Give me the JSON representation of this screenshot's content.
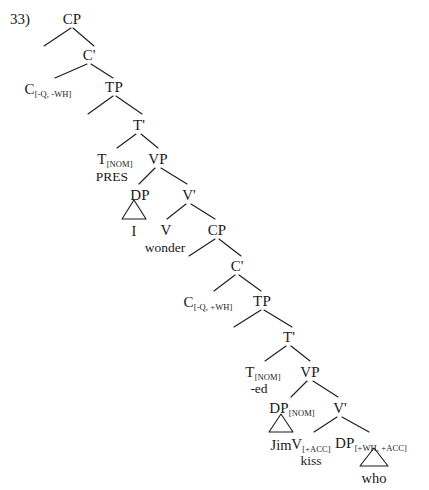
{
  "figure": {
    "example_number": "33)",
    "type": "syntax-tree",
    "sentence": "I wonder who Jim kissed"
  },
  "nodes": [
    {
      "id": "cp1",
      "label": "CP",
      "sub": "",
      "x": 72,
      "y": 12
    },
    {
      "id": "cbar1",
      "label": "C'",
      "sub": "",
      "x": 89,
      "y": 48
    },
    {
      "id": "c1",
      "label": "C",
      "sub": "[-Q, -WH]",
      "x": 48,
      "y": 82
    },
    {
      "id": "tp1",
      "label": "TP",
      "sub": "",
      "x": 114,
      "y": 80
    },
    {
      "id": "tbar1",
      "label": "T'",
      "sub": "",
      "x": 139,
      "y": 118
    },
    {
      "id": "t1",
      "label": "T",
      "sub": "[NOM]",
      "x": 115,
      "y": 152
    },
    {
      "id": "vp1",
      "label": "VP",
      "sub": "",
      "x": 158,
      "y": 152
    },
    {
      "id": "dp1",
      "label": "DP",
      "sub": "",
      "x": 140,
      "y": 188
    },
    {
      "id": "vbar1",
      "label": "V'",
      "sub": "",
      "x": 189,
      "y": 188
    },
    {
      "id": "v1",
      "label": "V",
      "sub": "",
      "x": 166,
      "y": 223
    },
    {
      "id": "cp2",
      "label": "CP",
      "sub": "",
      "x": 217,
      "y": 223
    },
    {
      "id": "cbar2",
      "label": "C'",
      "sub": "",
      "x": 237,
      "y": 259
    },
    {
      "id": "c2",
      "label": "C",
      "sub": "[-Q, +WH]",
      "x": 208,
      "y": 295
    },
    {
      "id": "tp2",
      "label": "TP",
      "sub": "",
      "x": 262,
      "y": 294
    },
    {
      "id": "tbar2",
      "label": "T'",
      "sub": "",
      "x": 289,
      "y": 330
    },
    {
      "id": "t2",
      "label": "T",
      "sub": "[NOM]",
      "x": 263,
      "y": 365
    },
    {
      "id": "vp2",
      "label": "VP",
      "sub": "",
      "x": 310,
      "y": 365
    },
    {
      "id": "dp2",
      "label": "DP",
      "sub": "[NOM]",
      "x": 292,
      "y": 401
    },
    {
      "id": "vbar2",
      "label": "V'",
      "sub": "",
      "x": 340,
      "y": 401
    },
    {
      "id": "v2",
      "label": "V",
      "sub": "[+ACC]",
      "x": 311,
      "y": 437
    },
    {
      "id": "dp3",
      "label": "DP",
      "sub": "[+WH, +ACC]",
      "x": 371,
      "y": 436
    }
  ],
  "leaves": [
    {
      "id": "leaf-i",
      "text": "I",
      "x": 134,
      "y": 224
    },
    {
      "id": "leaf-jim",
      "text": "Jim",
      "x": 281,
      "y": 438
    },
    {
      "id": "leaf-who",
      "text": "who",
      "x": 374,
      "y": 471
    }
  ],
  "morphemes": [
    {
      "id": "morph-pres",
      "text": "PRES",
      "x": 112,
      "y": 170
    },
    {
      "id": "morph-ed",
      "text": "-ed",
      "x": 259,
      "y": 382
    },
    {
      "id": "morph-wonder",
      "text": "wonder",
      "x": 165,
      "y": 241
    },
    {
      "id": "morph-kiss",
      "text": "kiss",
      "x": 311,
      "y": 454
    }
  ],
  "branches": [
    {
      "id": "cp1-spec",
      "x1": 71,
      "y1": 28,
      "x2": 44,
      "y2": 46
    },
    {
      "id": "cp1-cbar",
      "x1": 73,
      "y1": 28,
      "x2": 94,
      "y2": 46
    },
    {
      "id": "cbar1-c",
      "x1": 87,
      "y1": 64,
      "x2": 55,
      "y2": 78
    },
    {
      "id": "cbar1-tp",
      "x1": 91,
      "y1": 64,
      "x2": 113,
      "y2": 78
    },
    {
      "id": "tp1-spec",
      "x1": 113,
      "y1": 96,
      "x2": 88,
      "y2": 114
    },
    {
      "id": "tp1-tbar",
      "x1": 116,
      "y1": 96,
      "x2": 142,
      "y2": 114
    },
    {
      "id": "tbar1-t",
      "x1": 136,
      "y1": 134,
      "x2": 117,
      "y2": 148
    },
    {
      "id": "tbar1-vp",
      "x1": 141,
      "y1": 134,
      "x2": 158,
      "y2": 148
    },
    {
      "id": "vp1-dp",
      "x1": 155,
      "y1": 168,
      "x2": 139,
      "y2": 184
    },
    {
      "id": "vp1-vbar",
      "x1": 161,
      "y1": 168,
      "x2": 187,
      "y2": 184
    },
    {
      "id": "vbar1-v",
      "x1": 186,
      "y1": 204,
      "x2": 167,
      "y2": 219
    },
    {
      "id": "vbar1-cp",
      "x1": 191,
      "y1": 204,
      "x2": 215,
      "y2": 219
    },
    {
      "id": "cp2-spec",
      "x1": 215,
      "y1": 239,
      "x2": 189,
      "y2": 256
    },
    {
      "id": "cp2-cbar",
      "x1": 219,
      "y1": 239,
      "x2": 241,
      "y2": 256
    },
    {
      "id": "cbar2-c",
      "x1": 235,
      "y1": 275,
      "x2": 214,
      "y2": 291
    },
    {
      "id": "cbar2-tp",
      "x1": 239,
      "y1": 275,
      "x2": 261,
      "y2": 291
    },
    {
      "id": "tp2-spec",
      "x1": 261,
      "y1": 310,
      "x2": 234,
      "y2": 327
    },
    {
      "id": "tp2-tbar",
      "x1": 264,
      "y1": 310,
      "x2": 292,
      "y2": 327
    },
    {
      "id": "tbar2-t",
      "x1": 286,
      "y1": 346,
      "x2": 265,
      "y2": 361
    },
    {
      "id": "tbar2-vp",
      "x1": 291,
      "y1": 346,
      "x2": 310,
      "y2": 361
    },
    {
      "id": "vp2-dp",
      "x1": 307,
      "y1": 381,
      "x2": 291,
      "y2": 397
    },
    {
      "id": "vp2-vbar",
      "x1": 313,
      "y1": 381,
      "x2": 338,
      "y2": 397
    },
    {
      "id": "vbar2-v",
      "x1": 337,
      "y1": 417,
      "x2": 314,
      "y2": 432
    },
    {
      "id": "vbar2-dp",
      "x1": 342,
      "y1": 417,
      "x2": 369,
      "y2": 432
    }
  ],
  "triangles": [
    {
      "id": "triangle-i",
      "apex_x": 134,
      "apex_y": 200,
      "base_y": 219,
      "half_width": 12
    },
    {
      "id": "triangle-jim",
      "apex_x": 281,
      "apex_y": 414,
      "base_y": 432,
      "half_width": 12
    },
    {
      "id": "triangle-who",
      "apex_x": 374,
      "apex_y": 448,
      "base_y": 466,
      "half_width": 14
    }
  ]
}
